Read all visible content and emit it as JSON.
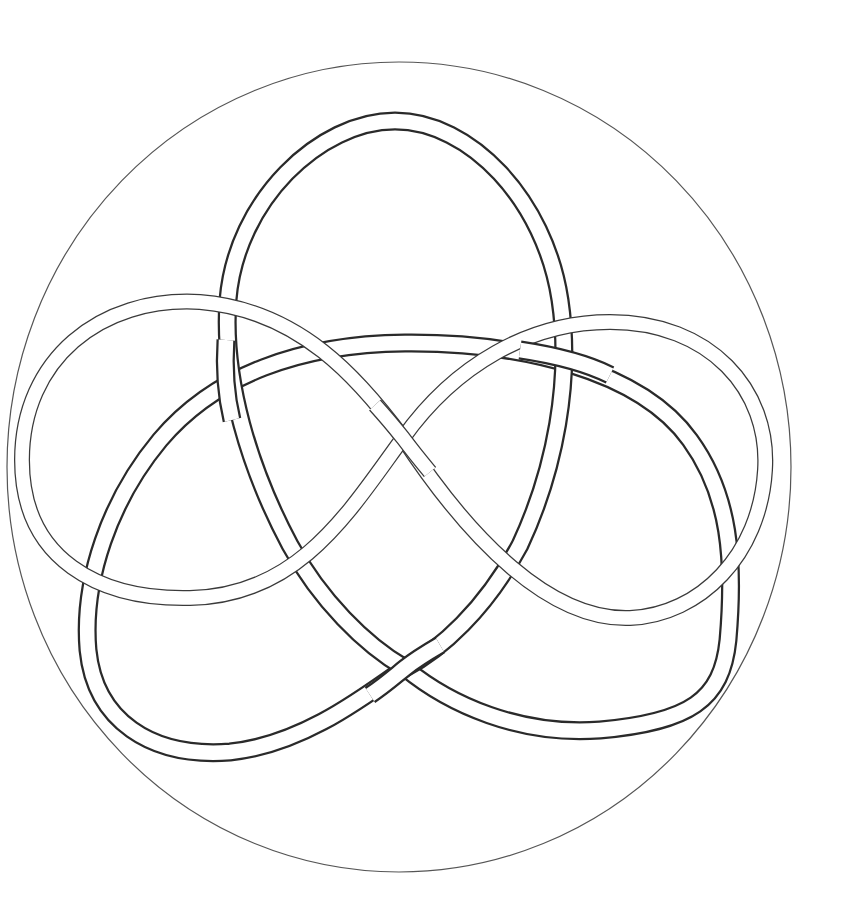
{
  "diagram": {
    "background": "#ffffff",
    "outer_circle": {
      "cx": 399,
      "cy": 467,
      "rx": 392,
      "ry": 405,
      "stroke": "#555555",
      "stroke_width": 1.2
    },
    "ribbons": [
      {
        "name": "vertical-oval",
        "stroke": "#2a2a2a",
        "outer_width": 19,
        "inner_width": 14
      },
      {
        "name": "lower-triangle",
        "stroke": "#2a2a2a",
        "outer_width": 19,
        "inner_width": 14
      },
      {
        "name": "figure-eight",
        "stroke": "#3a3a3a",
        "outer_width": 16,
        "inner_width": 13
      }
    ]
  }
}
